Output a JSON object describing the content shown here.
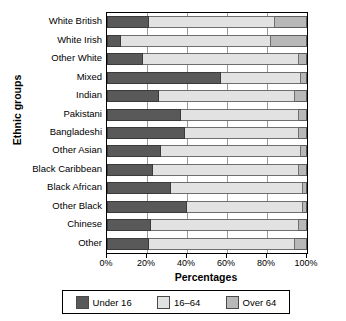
{
  "chart_data": {
    "type": "bar",
    "orientation": "horizontal",
    "stacked": true,
    "stacked_normalized": true,
    "title": "",
    "xlabel": "Percentages",
    "ylabel": "Ethnic groups",
    "xlim": [
      0,
      100
    ],
    "xticks": [
      0,
      20,
      40,
      60,
      80,
      100
    ],
    "xtick_labels": [
      "0%",
      "20%",
      "40%",
      "60%",
      "80%",
      "100%"
    ],
    "grid": true,
    "legend_position": "bottom",
    "categories": [
      "White British",
      "White Irish",
      "Other White",
      "Mixed",
      "Indian",
      "Pakistani",
      "Bangladeshi",
      "Other Asian",
      "Black Caribbean",
      "Black African",
      "Other Black",
      "Chinese",
      "Other"
    ],
    "series": [
      {
        "name": "Under 16",
        "color": "#595959",
        "values": [
          21,
          7,
          18,
          57,
          26,
          37,
          39,
          27,
          23,
          32,
          40,
          22,
          21
        ]
      },
      {
        "name": "16–64",
        "color": "#e2e2e2",
        "values": [
          63,
          75,
          78,
          40,
          68,
          59,
          57,
          70,
          73,
          66,
          58,
          74,
          73
        ]
      },
      {
        "name": "Over 64",
        "color": "#b8b8b8",
        "values": [
          16,
          18,
          4,
          3,
          6,
          4,
          4,
          3,
          4,
          2,
          2,
          4,
          6
        ]
      }
    ]
  },
  "legend": {
    "items": [
      {
        "label": "Under 16",
        "color": "#595959"
      },
      {
        "label": "16–64",
        "color": "#e2e2e2"
      },
      {
        "label": "Over 64",
        "color": "#b8b8b8"
      }
    ]
  }
}
